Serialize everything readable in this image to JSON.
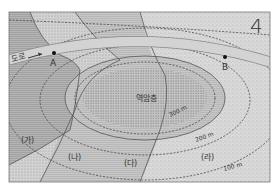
{
  "map": {
    "corner_number": "4",
    "road_label": "도로",
    "points": {
      "a": "A",
      "b": "B"
    },
    "core_layer_label": "역암층",
    "contours": [
      "300 m",
      "200 m",
      "100 m"
    ],
    "regions": [
      "(가)",
      "(나)",
      "(다)",
      "(라)"
    ],
    "colors": {
      "region_ga": "#a9a9a9",
      "region_na": "#d0d0d0",
      "region_da": "#bdbdbd",
      "region_ra": "#d6d6d6",
      "core": "#c4c4c4",
      "road": "#cfcfcf",
      "line": "#555555"
    }
  }
}
